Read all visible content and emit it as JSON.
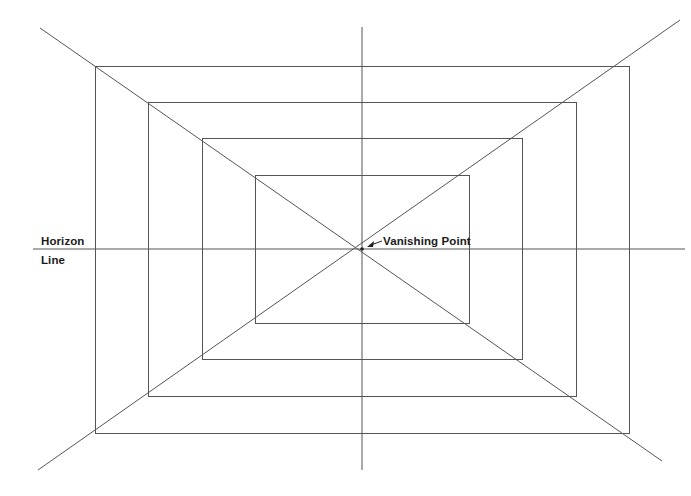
{
  "diagram": {
    "colors": {
      "background": "#ffffff",
      "line": "#555555",
      "label": "#1a1a1a"
    },
    "labels": {
      "horizon_line_1": "Horizon",
      "horizon_line_2": "Line",
      "vanishing_point": "Vanishing Point"
    },
    "vanishing_point": {
      "x": 362,
      "y": 249
    },
    "horizon_line": {
      "x1": 33,
      "y1": 249,
      "x2": 685,
      "y2": 249
    },
    "vertical_line": {
      "x1": 362,
      "y1": 27,
      "x2": 362,
      "y2": 470
    },
    "diagonals": [
      {
        "name": "diagonal-top-left-to-bottom-right",
        "x1": 40,
        "y1": 28,
        "x2": 662,
        "y2": 461
      },
      {
        "name": "diagonal-bottom-left-to-top-right",
        "x1": 38,
        "y1": 470,
        "x2": 680,
        "y2": 20
      }
    ],
    "rectangles": [
      {
        "name": "rectangle-1",
        "x": 95,
        "y": 66,
        "width": 534,
        "height": 367
      },
      {
        "name": "rectangle-2",
        "x": 148,
        "y": 102,
        "width": 428,
        "height": 294
      },
      {
        "name": "rectangle-3",
        "x": 202,
        "y": 138,
        "width": 320,
        "height": 221
      },
      {
        "name": "rectangle-4",
        "x": 255,
        "y": 175,
        "width": 214,
        "height": 148
      }
    ],
    "arrow": {
      "from_x": 382,
      "from_y": 241,
      "to_x": 367,
      "to_y": 247
    }
  }
}
